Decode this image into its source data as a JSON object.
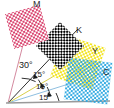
{
  "diagram": {
    "background": "#ffffff",
    "baseline_color": "#9a9a9a",
    "vertex": {
      "x": 8,
      "y": 103
    }
  },
  "channels": [
    {
      "key": "magenta",
      "label": "M",
      "color": "#d9456f",
      "angle_deg": 75,
      "leader_color": "#d48aa0",
      "label_pos": {
        "x": 33,
        "y": 1
      },
      "patch": {
        "cx": 26,
        "cy": 27,
        "size": 40,
        "rotate": -15,
        "cell": 4
      }
    },
    {
      "key": "black",
      "label": "K",
      "color": "#000000",
      "angle_deg": 45,
      "leader_color": "#3a3a3a",
      "label_pos": {
        "x": 76,
        "y": 27
      },
      "patch": {
        "cx": 60,
        "cy": 47,
        "size": 40,
        "rotate": 45,
        "cell": 4
      }
    },
    {
      "key": "yellow",
      "label": "Y",
      "color": "#f2e41f",
      "angle_deg": 90,
      "leader_color": "#d8cf4a",
      "label_pos": {
        "x": 92,
        "y": 48
      },
      "patch": {
        "cx": 78,
        "cy": 64,
        "size": 40,
        "rotate": 20,
        "cell": 4
      }
    },
    {
      "key": "cyan",
      "label": "C",
      "color": "#2aa7e0",
      "angle_deg": 15,
      "leader_color": "#8fbfe0",
      "label_pos": {
        "x": 103,
        "y": 69
      },
      "patch": {
        "cx": 88,
        "cy": 82,
        "size": 40,
        "rotate": 8,
        "cell": 4
      }
    }
  ],
  "angles": [
    {
      "id": "a30",
      "value": "30°",
      "pos": {
        "x": 19,
        "y": 62
      }
    },
    {
      "id": "a15a",
      "value": "15°",
      "pos": {
        "x": 33,
        "y": 72
      }
    },
    {
      "id": "a15b",
      "value": "15°",
      "pos": {
        "x": 35,
        "y": 84
      }
    },
    {
      "id": "a15c",
      "value": "15°",
      "pos": {
        "x": 38,
        "y": 95
      }
    }
  ],
  "rays": [
    {
      "id": "ray-magenta",
      "to": {
        "x": 33,
        "y": 8
      },
      "color": "#d48aa0"
    },
    {
      "id": "ray-black",
      "to": {
        "x": 76,
        "y": 30
      },
      "color": "#2e2e2e"
    },
    {
      "id": "ray-yellow",
      "to": {
        "x": 92,
        "y": 52
      },
      "color": "#d8cf4a"
    },
    {
      "id": "ray-cyan",
      "to": {
        "x": 104,
        "y": 73
      },
      "color": "#8fbfe0"
    },
    {
      "id": "ray-baseline",
      "to": {
        "x": 110,
        "y": 100
      },
      "color": "#9a9a9a"
    }
  ],
  "arcs": [
    {
      "id": "arc-30",
      "r": 28
    },
    {
      "id": "arc-15a",
      "r": 36
    },
    {
      "id": "arc-15b",
      "r": 44
    },
    {
      "id": "arc-15c",
      "r": 52
    }
  ]
}
